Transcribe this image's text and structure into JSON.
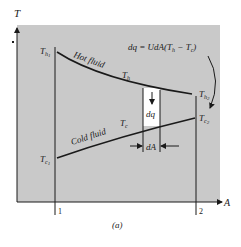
{
  "figure": {
    "caption": "(a)",
    "background_panel_color": "#c9c9c9",
    "ink_color": "#1a1a1a",
    "axes": {
      "y_label": "T",
      "x_label": "A"
    },
    "stations": [
      {
        "label": "1"
      },
      {
        "label": "2"
      }
    ],
    "curves": {
      "hot": {
        "name": "Hot fluid",
        "label": "T",
        "label_sub": "h"
      },
      "cold": {
        "name": "Cold fluid",
        "label": "T",
        "label_sub": "c"
      }
    },
    "endpoints": {
      "th1": {
        "main": "T",
        "sub": "h",
        "subsub": "1"
      },
      "th2": {
        "main": "T",
        "sub": "h",
        "subsub": "2"
      },
      "tc1": {
        "main": "T",
        "sub": "c",
        "subsub": "1"
      },
      "tc2": {
        "main": "T",
        "sub": "c",
        "subsub": "2"
      }
    },
    "element": {
      "heat_label": "dq",
      "area_label": "dA"
    },
    "equation": "dq = UdA(Th − Tc)",
    "equation_parts": {
      "lhs": "dq = ",
      "mid": "UdA(T",
      "sub_h": "h",
      "minus": " − T",
      "sub_c": "c",
      "close": ")"
    }
  }
}
